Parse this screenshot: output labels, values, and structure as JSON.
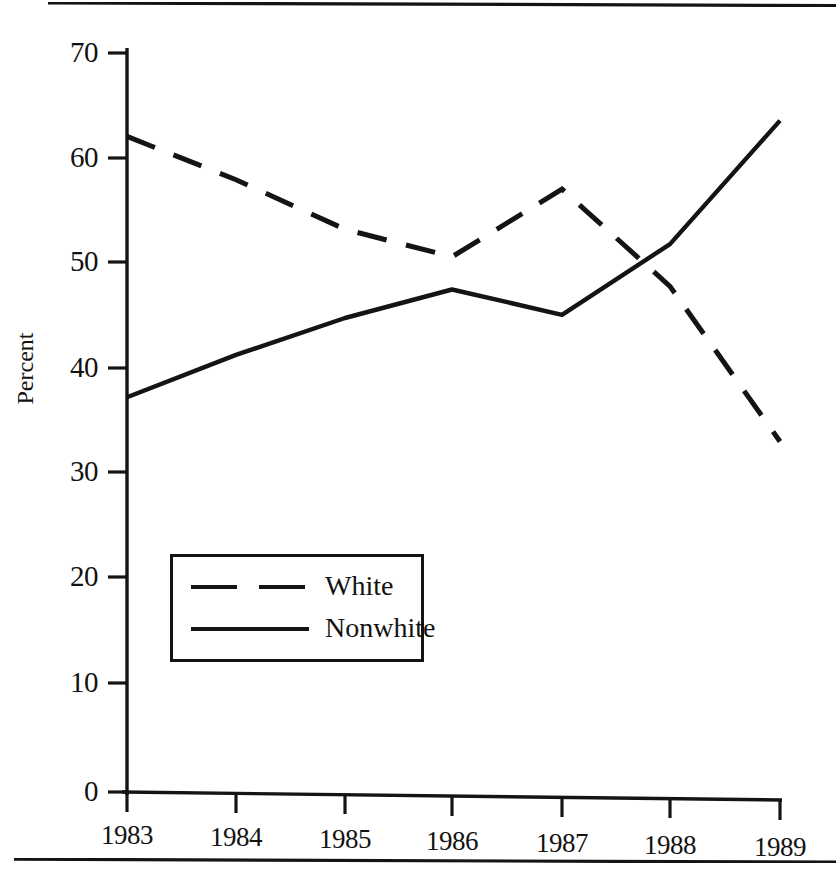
{
  "figure": {
    "axis_title_y": "Percent",
    "legend": {
      "items": [
        {
          "label": "White",
          "style": "dashed"
        },
        {
          "label": "Nonwhite",
          "style": "solid"
        }
      ]
    }
  },
  "chart_data": {
    "type": "line",
    "title": "",
    "xlabel": "",
    "ylabel": "Percent",
    "categories": [
      "1983",
      "1984",
      "1985",
      "1986",
      "1987",
      "1988",
      "1989"
    ],
    "x": [
      1983,
      1984,
      1985,
      1986,
      1987,
      1988,
      1989
    ],
    "series": [
      {
        "name": "White",
        "style": "dashed",
        "color": "#141414",
        "values": [
          62.1,
          58.0,
          53.3,
          50.7,
          57.1,
          47.9,
          33.2
        ]
      },
      {
        "name": "Nonwhite",
        "style": "solid",
        "color": "#141414",
        "values": [
          37.4,
          41.4,
          44.9,
          47.6,
          45.2,
          51.9,
          63.6
        ]
      }
    ],
    "ylim": [
      0,
      70
    ],
    "yticks": [
      0,
      10,
      20,
      30,
      40,
      50,
      60,
      70
    ],
    "ytick_labels": [
      "0",
      "10",
      "20",
      "30",
      "40",
      "50",
      "60",
      "70"
    ],
    "xticks": [
      1983,
      1984,
      1985,
      1986,
      1987,
      1988,
      1989
    ],
    "xtick_labels": [
      "1983",
      "1984",
      "1985",
      "1986",
      "1987",
      "1988",
      "1989"
    ],
    "grid": false,
    "legend_position": "center-left"
  }
}
